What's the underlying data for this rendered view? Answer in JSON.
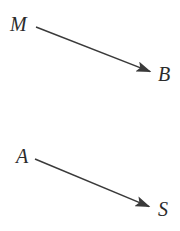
{
  "figure": {
    "type": "diagram",
    "background_color": "#ffffff",
    "stroke_color": "#3a3a3a",
    "text_color": "#2b2b2b",
    "width": 180,
    "height": 231
  },
  "diagrams": [
    {
      "name": "upper-arrow-diagram",
      "source_label": "M",
      "target_label": "B",
      "arrow": {
        "start_x": 36,
        "start_y": 27,
        "end_x": 151,
        "end_y": 72,
        "head": "solid-triangle",
        "direction": "down-right"
      }
    },
    {
      "name": "lower-arrow-diagram",
      "source_label": "A",
      "target_label": "S",
      "arrow": {
        "start_x": 35,
        "start_y": 159,
        "end_x": 150,
        "end_y": 207,
        "head": "solid-triangle",
        "direction": "down-right"
      }
    }
  ],
  "labels": {
    "m": "M",
    "b": "B",
    "a": "A",
    "s": "S"
  }
}
